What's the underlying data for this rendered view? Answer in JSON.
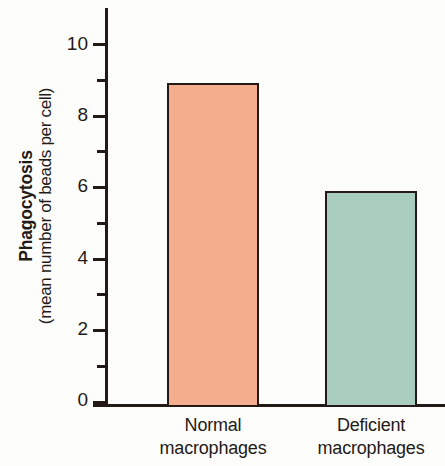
{
  "figure": {
    "background_color": "#fdfdfc",
    "axis_color": "#231a16",
    "text_color": "#231a16"
  },
  "axis": {
    "y_title_main": "Phagocytosis",
    "y_title_sub": "(mean number of beads per cell)",
    "y_tick_labels": [
      "10",
      "8",
      "6",
      "4",
      "2",
      "0"
    ]
  },
  "categories": [
    {
      "line1": "Normal",
      "line2": "macrophages",
      "fill": "#f4ae8e"
    },
    {
      "line1": "Deficient",
      "line2": "macrophages",
      "fill": "#a8cdbf"
    }
  ],
  "chart_data": {
    "type": "bar",
    "title": "",
    "categories": [
      "Normal macrophages",
      "Deficient macrophages"
    ],
    "values": [
      9,
      6
    ],
    "series": [
      {
        "name": "Phagocytosis (mean number of beads per cell)",
        "values": [
          9,
          6
        ],
        "colors": [
          "#f4ae8e",
          "#a8cdbf"
        ]
      }
    ],
    "xlabel": "",
    "ylabel": "Phagocytosis (mean number of beads per cell)",
    "ylim": [
      0,
      11
    ],
    "y_major_ticks": [
      0,
      2,
      4,
      6,
      8,
      10
    ],
    "y_minor_ticks": [
      1,
      3,
      5,
      7,
      9
    ],
    "grid": false,
    "legend": "none",
    "bar_edge_color": "#231a16"
  }
}
